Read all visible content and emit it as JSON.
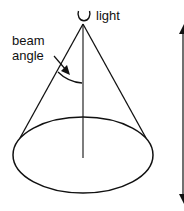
{
  "diagram": {
    "labels": {
      "light": "light",
      "beam_line1": "beam",
      "beam_line2": "angle"
    },
    "colors": {
      "stroke": "#111111",
      "background": "#ffffff"
    }
  }
}
